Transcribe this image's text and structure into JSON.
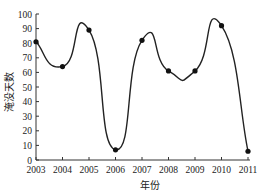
{
  "chart_data": {
    "type": "line",
    "title": "",
    "xlabel": "年份",
    "ylabel": "淹没天数",
    "categories": [
      "2003",
      "2004",
      "2005",
      "2006",
      "2007",
      "2008",
      "2009",
      "2010",
      "2011"
    ],
    "series": [
      {
        "name": "淹没天数",
        "values": [
          81,
          64,
          89,
          7,
          82,
          61,
          61,
          92,
          6
        ],
        "smooth": true,
        "marker": "circle",
        "color": "#222222"
      }
    ],
    "ylim": [
      0,
      100
    ],
    "yticks": [
      0,
      10,
      20,
      30,
      40,
      50,
      60,
      70,
      80,
      90,
      100
    ],
    "grid": false,
    "legend": "none"
  }
}
